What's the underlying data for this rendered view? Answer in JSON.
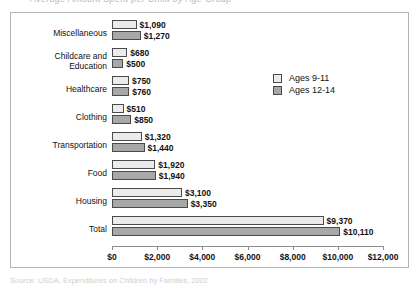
{
  "title_clipped": "Average Amount Spent per Child by Age Group",
  "source_clipped": "Source: USDA, Expenditures on Children by Families, 2002",
  "legend": {
    "position": "top-right",
    "items": [
      {
        "label": "Ages 9-11",
        "color": "#ebebeb"
      },
      {
        "label": "Ages 12-14",
        "color": "#a8a8a8"
      }
    ]
  },
  "axis": {
    "ticks": [
      "$0",
      "$2,000",
      "$4,000",
      "$6,000",
      "$8,000",
      "$10,000",
      "$12,000"
    ],
    "tick_values": [
      0,
      2000,
      4000,
      6000,
      8000,
      10000,
      12000
    ]
  },
  "chart_data": {
    "type": "bar",
    "orientation": "horizontal",
    "title": "Average Amount Spent per Child by Age Group",
    "xlabel": "",
    "ylabel": "",
    "xlim": [
      0,
      12000
    ],
    "grid": false,
    "legend_position": "top-right",
    "categories": [
      "Miscellaneous",
      "Childcare and\nEducation",
      "Healthcare",
      "Clothing",
      "Transportation",
      "Food",
      "Housing",
      "Total"
    ],
    "series": [
      {
        "name": "Ages 9-11",
        "color": "#ebebeb",
        "values": [
          1090,
          680,
          750,
          510,
          1320,
          1920,
          3100,
          9370
        ],
        "labels": [
          "$1,090",
          "$680",
          "$750",
          "$510",
          "$1,320",
          "$1,920",
          "$3,100",
          "$9,370"
        ]
      },
      {
        "name": "Ages 12-14",
        "color": "#a8a8a8",
        "values": [
          1270,
          500,
          760,
          850,
          1440,
          1940,
          3350,
          10110
        ],
        "labels": [
          "$1,270",
          "$500",
          "$760",
          "$850",
          "$1,440",
          "$1,940",
          "$3,350",
          "$10,110"
        ]
      }
    ]
  }
}
